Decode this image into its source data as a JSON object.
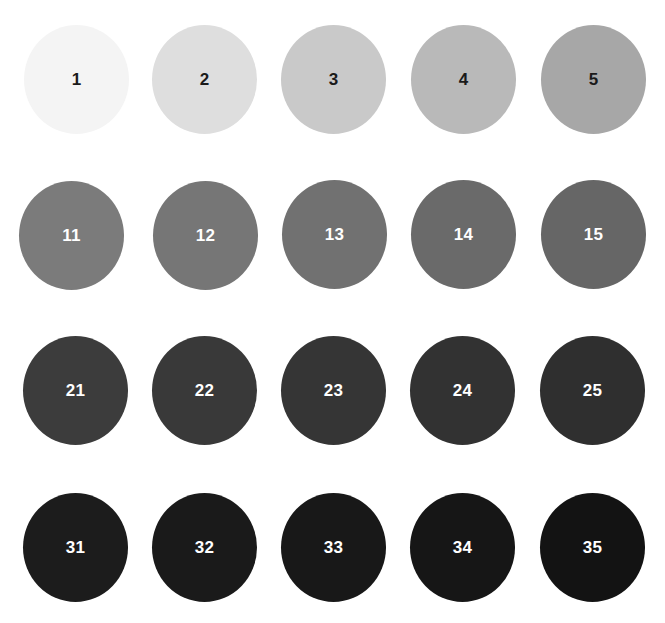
{
  "swatches": [
    {
      "label": "1",
      "fill": "#f4f4f4",
      "text_color": "#1a1a1a"
    },
    {
      "label": "2",
      "fill": "#dedede",
      "text_color": "#1a1a1a"
    },
    {
      "label": "3",
      "fill": "#c9c9c9",
      "text_color": "#1a1a1a"
    },
    {
      "label": "4",
      "fill": "#b9b9b9",
      "text_color": "#1a1a1a"
    },
    {
      "label": "5",
      "fill": "#a7a7a7",
      "text_color": "#1a1a1a"
    },
    {
      "label": "11",
      "fill": "#7b7b7b",
      "text_color": "#ffffff"
    },
    {
      "label": "12",
      "fill": "#767676",
      "text_color": "#ffffff"
    },
    {
      "label": "13",
      "fill": "#717171",
      "text_color": "#ffffff"
    },
    {
      "label": "14",
      "fill": "#6a6a6a",
      "text_color": "#ffffff"
    },
    {
      "label": "15",
      "fill": "#666666",
      "text_color": "#ffffff"
    },
    {
      "label": "21",
      "fill": "#3c3c3c",
      "text_color": "#ffffff"
    },
    {
      "label": "22",
      "fill": "#393939",
      "text_color": "#ffffff"
    },
    {
      "label": "23",
      "fill": "#353535",
      "text_color": "#ffffff"
    },
    {
      "label": "24",
      "fill": "#323232",
      "text_color": "#ffffff"
    },
    {
      "label": "25",
      "fill": "#2f2f2f",
      "text_color": "#ffffff"
    },
    {
      "label": "31",
      "fill": "#1c1c1c",
      "text_color": "#ffffff"
    },
    {
      "label": "32",
      "fill": "#1a1a1a",
      "text_color": "#ffffff"
    },
    {
      "label": "33",
      "fill": "#181818",
      "text_color": "#ffffff"
    },
    {
      "label": "34",
      "fill": "#161616",
      "text_color": "#ffffff"
    },
    {
      "label": "35",
      "fill": "#131313",
      "text_color": "#ffffff"
    }
  ]
}
